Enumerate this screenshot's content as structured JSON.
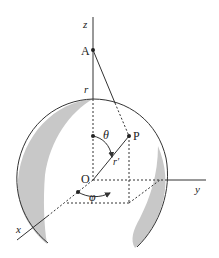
{
  "diagram": {
    "type": "spherical-coordinates-diagram",
    "labels": {
      "z_axis": "z",
      "y_axis": "y",
      "x_axis": "x",
      "point_A": "A",
      "point_P": "P",
      "origin": "O",
      "radius": "r",
      "r_prime": "r′",
      "theta": "θ",
      "phi": "φ"
    },
    "colors": {
      "stroke": "#333333",
      "shade": "#c8c8c8",
      "background": "#ffffff"
    }
  }
}
